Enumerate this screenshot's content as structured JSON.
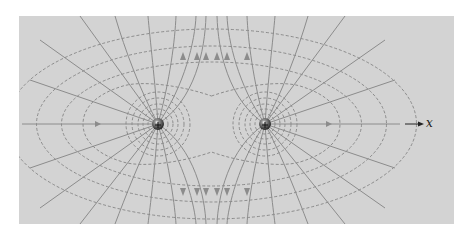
{
  "figure": {
    "type": "electric field diagram",
    "axis_label": "x",
    "colors": {
      "background": "#d3d3d3",
      "field_line": "#8c8c8c",
      "equipotential": "#7a7a7a",
      "charge": "#3a3a3a"
    },
    "charges": [
      {
        "sign": "+",
        "x": 158,
        "y": 124
      },
      {
        "sign": "+",
        "x": 265,
        "y": 124
      }
    ]
  }
}
